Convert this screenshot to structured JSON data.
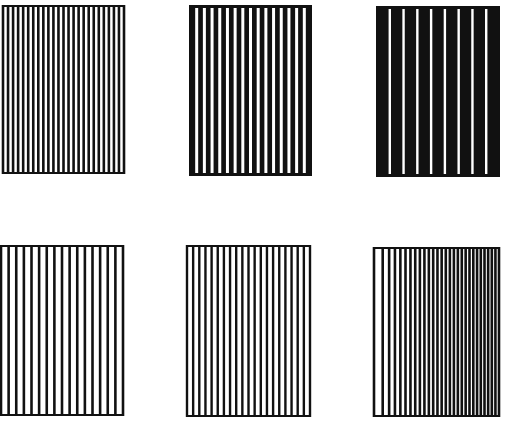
{
  "figure": {
    "background": "#ffffff",
    "ink": "#111111",
    "panels": [
      {
        "id": "top-left",
        "x": 3,
        "y": 5,
        "w": 121,
        "h": 169,
        "mode": "black-lines",
        "count": 24,
        "stroke": 2.6,
        "ramp": 1.0
      },
      {
        "id": "top-middle",
        "x": 189,
        "y": 5,
        "w": 123,
        "h": 171,
        "mode": "white-lines",
        "count": 16,
        "stroke": 3.0,
        "ramp": 1.0
      },
      {
        "id": "top-right",
        "x": 376,
        "y": 6,
        "w": 124,
        "h": 171,
        "mode": "white-lines",
        "count": 9,
        "stroke": 2.4,
        "ramp": 1.0
      },
      {
        "id": "bottom-left",
        "x": 1,
        "y": 245,
        "w": 122,
        "h": 171,
        "mode": "black-lines",
        "count": 16,
        "stroke": 2.6,
        "ramp": 1.0
      },
      {
        "id": "bottom-middle",
        "x": 187,
        "y": 245,
        "w": 123,
        "h": 172,
        "mode": "black-lines",
        "count": 20,
        "stroke": 2.4,
        "ramp": 1.0
      },
      {
        "id": "bottom-right",
        "x": 374,
        "y": 247,
        "w": 125,
        "h": 170,
        "mode": "black-lines",
        "count": 28,
        "stroke": 2.6,
        "ramp": 0.8
      }
    ]
  }
}
